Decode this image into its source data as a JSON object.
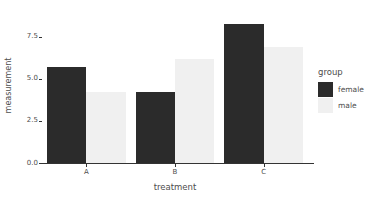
{
  "chart_data": {
    "type": "bar",
    "title": "",
    "subtitle": "",
    "xlabel": "treatment",
    "ylabel": "measurement",
    "categories": [
      "A",
      "B",
      "C"
    ],
    "series": [
      {
        "name": "female",
        "values": [
          5.7,
          4.2,
          8.25
        ],
        "color": "#2b2b2b"
      },
      {
        "name": "male",
        "values": [
          4.2,
          6.2,
          6.9
        ],
        "color": "#f0f0f0"
      }
    ],
    "ylim": [
      0,
      9.2
    ],
    "ytick_values": [
      0,
      2.5,
      5,
      7.5
    ],
    "ytick_labels": [
      "0.0",
      "2.5",
      "5.0",
      "7.5"
    ],
    "grid": false,
    "legend": {
      "title": "group",
      "position": "right",
      "entries": [
        {
          "label": "female",
          "color": "#2b2b2b"
        },
        {
          "label": "male",
          "color": "#f0f0f0"
        }
      ]
    },
    "axis_color": "#333333",
    "text_color": "#4d4d4d",
    "background": "#ffffff"
  }
}
